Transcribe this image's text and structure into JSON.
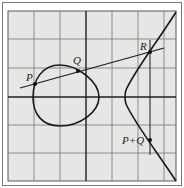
{
  "figure": {
    "colors": {
      "background": "#ffffff",
      "paper": "#e6e6e4",
      "grid": "#6f6f6f",
      "axis": "#1e1e1e",
      "curve": "#1a1a1a",
      "frame": "#5a5a5a"
    },
    "labels": {
      "p": "P",
      "q": "Q",
      "r": "R",
      "p_plus_q": "P+Q"
    },
    "points": {
      "p": [
        35,
        84
      ],
      "q": [
        78,
        71
      ],
      "r": [
        150,
        52
      ],
      "p_plus_q": [
        150,
        140
      ]
    }
  }
}
